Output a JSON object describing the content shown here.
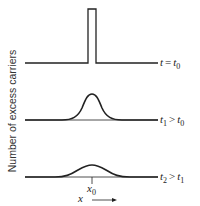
{
  "diagram": {
    "y_axis_label": "Number of excess carriers",
    "panels": [
      {
        "name": "t0",
        "shape": "rectangular-pulse",
        "label": {
          "var": "t",
          "op": "=",
          "rhs_var": "t",
          "rhs_sub": "0"
        }
      },
      {
        "name": "t1",
        "shape": "gaussian-narrow",
        "label": {
          "var": "t",
          "var_sub": "1",
          "op": ">",
          "rhs_var": "t",
          "rhs_sub": "0"
        }
      },
      {
        "name": "t2",
        "shape": "gaussian-wide",
        "label": {
          "var": "t",
          "var_sub": "2",
          "op": ">",
          "rhs_var": "t",
          "rhs_sub": "1"
        }
      }
    ],
    "position_marker": {
      "var": "x",
      "sub": "0"
    },
    "x_axis": {
      "var": "x",
      "direction": "right-arrow"
    }
  },
  "colors": {
    "line": "#222222",
    "background": "#ffffff"
  }
}
